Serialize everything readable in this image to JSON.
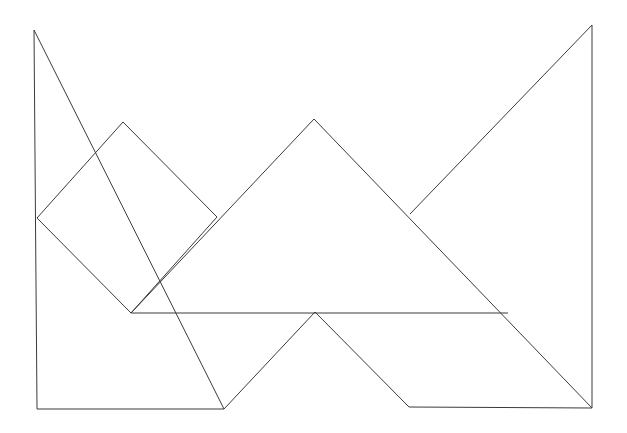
{
  "figure": {
    "background_color": "#ffffff",
    "stroke_color": "#3b3b3b",
    "stroke_width": 1,
    "fill": "none",
    "width": 627,
    "height": 433
  },
  "chart_data": {
    "type": "diagram",
    "subtype": "geometric-dissection",
    "xlabel": "",
    "ylabel": "",
    "xlim": [
      0,
      627
    ],
    "ylim": [
      433,
      0
    ],
    "grid": false,
    "legend": "none",
    "coordinate_system": "screen-pixels-origin-top-left",
    "vertices": {
      "top_left_apex": [
        34,
        30
      ],
      "top_right_apex": [
        592,
        25
      ],
      "left_edge_mid": [
        37,
        218
      ],
      "bottom_left_corner": [
        37,
        409
      ],
      "bottom_right_corner": [
        592,
        408
      ],
      "square_top_corner": [
        123,
        122
      ],
      "square_right_corner": [
        217,
        217
      ],
      "square_bottom_corner": [
        131,
        313
      ],
      "center_peak": [
        314,
        119
      ],
      "right_crossing": [
        410,
        214
      ],
      "lower_peak": [
        315,
        312
      ],
      "v_bottom": [
        224,
        409
      ],
      "parallelogram_bottom_left": [
        409,
        407
      ],
      "horizontal_right_end": [
        508,
        313
      ]
    },
    "pieces": [
      {
        "name": "large-left-triangle",
        "shape": "right-triangle",
        "points": [
          [
            34,
            30
          ],
          [
            217,
            217
          ],
          [
            34,
            409
          ]
        ],
        "note": "left vertical leg from top-left apex down to bottom-left corner"
      },
      {
        "name": "rotated-square",
        "shape": "square",
        "points": [
          [
            123,
            122
          ],
          [
            217,
            217
          ],
          [
            131,
            313
          ],
          [
            37,
            218
          ]
        ]
      },
      {
        "name": "center-large-triangle",
        "shape": "isosceles-triangle",
        "points": [
          [
            314,
            119
          ],
          [
            508,
            313
          ],
          [
            131,
            313
          ]
        ]
      },
      {
        "name": "large-right-triangle",
        "shape": "right-triangle",
        "points": [
          [
            592,
            25
          ],
          [
            592,
            408
          ],
          [
            410,
            214
          ]
        ],
        "note": "hypotenuse runs down-left from top-right apex, leg descends to bottom-right"
      },
      {
        "name": "parallelogram",
        "shape": "parallelogram",
        "points": [
          [
            315,
            312
          ],
          [
            508,
            313
          ],
          [
            592,
            408
          ],
          [
            409,
            407
          ]
        ]
      },
      {
        "name": "small-bottom-triangle",
        "shape": "triangle",
        "points": [
          [
            131,
            313
          ],
          [
            224,
            409
          ],
          [
            315,
            312
          ]
        ]
      }
    ],
    "segments": [
      {
        "name": "left-vertical-edge",
        "from": [
          34,
          30
        ],
        "to": [
          37,
          409
        ]
      },
      {
        "name": "bottom-left-horizontal-edge",
        "from": [
          37,
          409
        ],
        "to": [
          224,
          409
        ]
      },
      {
        "name": "top-left-hypotenuse",
        "from": [
          34,
          30
        ],
        "to": [
          224,
          409
        ]
      },
      {
        "name": "square-upper-left-side",
        "from": [
          37,
          218
        ],
        "to": [
          123,
          122
        ]
      },
      {
        "name": "square-upper-right-side",
        "from": [
          123,
          122
        ],
        "to": [
          217,
          217
        ]
      },
      {
        "name": "square-lower-right-side",
        "from": [
          217,
          217
        ],
        "to": [
          131,
          313
        ]
      },
      {
        "name": "square-lower-left-side",
        "from": [
          131,
          313
        ],
        "to": [
          37,
          218
        ]
      },
      {
        "name": "center-triangle-left-side",
        "from": [
          131,
          313
        ],
        "to": [
          314,
          119
        ]
      },
      {
        "name": "center-triangle-right-side",
        "from": [
          314,
          119
        ],
        "to": [
          592,
          408
        ]
      },
      {
        "name": "center-horizontal-baseline",
        "from": [
          131,
          313
        ],
        "to": [
          508,
          313
        ]
      },
      {
        "name": "right-triangle-hypotenuse",
        "from": [
          592,
          25
        ],
        "to": [
          410,
          214
        ]
      },
      {
        "name": "right-vertical-edge",
        "from": [
          592,
          25
        ],
        "to": [
          592,
          408
        ]
      },
      {
        "name": "parallelogram-left-side",
        "from": [
          315,
          312
        ],
        "to": [
          409,
          407
        ]
      },
      {
        "name": "parallelogram-bottom-side",
        "from": [
          409,
          407
        ],
        "to": [
          592,
          408
        ]
      },
      {
        "name": "small-triangle-right-side",
        "from": [
          224,
          409
        ],
        "to": [
          315,
          312
        ]
      }
    ]
  }
}
